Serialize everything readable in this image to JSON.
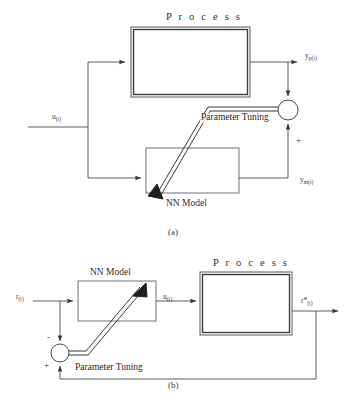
{
  "figure": {
    "caption_a": "(a)",
    "caption_b": "(b)"
  },
  "diagram_a": {
    "process_title": "P r o c e s s",
    "nn_model_label": "NN Model",
    "parameter_tuning_label": "Parameter Tuning",
    "input_signal": "u",
    "input_signal_sub": "(t)",
    "process_output": "y",
    "process_output_sub": "p(t)",
    "model_output": "y",
    "model_output_sub": "m(t)",
    "sum_sign_plus": "+"
  },
  "diagram_b": {
    "process_title": "P r o c e s s",
    "nn_model_label": "NN Model",
    "parameter_tuning_label": "Parameter Tuning",
    "reference_input": "r",
    "reference_input_sub": "(t)",
    "control_signal": "u",
    "control_signal_sub": "(t)",
    "output_signal": "r*",
    "output_signal_sub": "(t)",
    "sum_sign_minus": "-",
    "sum_sign_plus": "+"
  },
  "colors": {
    "line": "#4a4a4a",
    "line_dark": "#2b2b2b",
    "background": "#ffffff"
  }
}
